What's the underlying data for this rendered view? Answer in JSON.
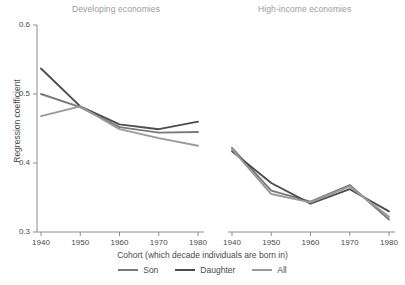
{
  "figure": {
    "xlabel": "Cohort (which decade individuals are born in)",
    "ylabel": "Regression coefficient"
  },
  "legend": {
    "items": [
      {
        "label": "Son",
        "color": "#7a7a7a"
      },
      {
        "label": "Daughter",
        "color": "#4d4d4d"
      },
      {
        "label": "All",
        "color": "#9a9a9a"
      }
    ]
  },
  "chart_data": [
    {
      "type": "line",
      "title": "Developing economies",
      "xlabel": "Cohort (which decade individuals are born in)",
      "ylabel": "Regression coefficient",
      "x": [
        1940,
        1950,
        1960,
        1970,
        1980
      ],
      "xticklabels": [
        "1940",
        "1950",
        "1960",
        "1970",
        "1980"
      ],
      "xlim": [
        1935,
        1985
      ],
      "ylim": [
        0.3,
        0.6
      ],
      "yticks": [
        0.3,
        0.4,
        0.5,
        0.6
      ],
      "yticklabels": [
        "0.3",
        "0.4",
        "0.5",
        "0.6"
      ],
      "grid": false,
      "legend_position": "bottom-center",
      "series": [
        {
          "name": "Son",
          "color": "#7a7a7a",
          "values": [
            0.5,
            0.481,
            0.452,
            0.444,
            0.445
          ]
        },
        {
          "name": "Daughter",
          "color": "#4d4d4d",
          "values": [
            0.537,
            0.482,
            0.456,
            0.449,
            0.46
          ]
        },
        {
          "name": "All",
          "color": "#9a9a9a",
          "values": [
            0.468,
            0.482,
            0.449,
            0.436,
            0.425
          ]
        }
      ]
    },
    {
      "type": "line",
      "title": "High-income economies",
      "xlabel": "Cohort (which decade individuals are born in)",
      "ylabel": "Regression coefficient",
      "x": [
        1940,
        1950,
        1960,
        1970,
        1980
      ],
      "xticklabels": [
        "1940",
        "1950",
        "1960",
        "1970",
        "1980"
      ],
      "xlim": [
        1935,
        1985
      ],
      "ylim": [
        0.3,
        0.6
      ],
      "yticks": [
        0.3,
        0.4,
        0.5,
        0.6
      ],
      "yticklabels": [
        "0.3",
        "0.4",
        "0.5",
        "0.6"
      ],
      "grid": false,
      "legend_position": "bottom-center",
      "series": [
        {
          "name": "Son",
          "color": "#7a7a7a",
          "values": [
            0.422,
            0.36,
            0.344,
            0.368,
            0.318
          ]
        },
        {
          "name": "Daughter",
          "color": "#4d4d4d",
          "values": [
            0.417,
            0.371,
            0.341,
            0.362,
            0.33
          ]
        },
        {
          "name": "All",
          "color": "#9a9a9a",
          "values": [
            0.42,
            0.355,
            0.343,
            0.366,
            0.322
          ]
        }
      ]
    }
  ]
}
